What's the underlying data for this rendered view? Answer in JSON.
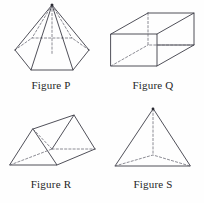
{
  "page": {
    "background_color": "#fefefe",
    "line_color": "#3c3c46",
    "hidden_line_color": "#6e6e78"
  },
  "figures": [
    {
      "id": "figure-p",
      "caption": "Figure P",
      "shape_name": "hexagonal-pyramid",
      "faces": 7,
      "edges": 12,
      "vertices": 7,
      "base_shape": "hexagon",
      "apex": {
        "x": 52,
        "y": 5
      },
      "base_vertices": [
        {
          "x": 15,
          "y": 50
        },
        {
          "x": 31,
          "y": 70
        },
        {
          "x": 73,
          "y": 70
        },
        {
          "x": 89,
          "y": 50
        },
        {
          "x": 72,
          "y": 38
        },
        {
          "x": 32,
          "y": 38
        }
      ],
      "hidden_edge_indices": [
        4,
        5
      ],
      "center": {
        "x": 52,
        "y": 54
      }
    },
    {
      "id": "figure-q",
      "caption": "Figure Q",
      "shape_name": "rectangular-prism",
      "faces": 6,
      "edges": 12,
      "vertices": 8,
      "base_shape": "rectangle",
      "front_face": [
        {
          "x": 9,
          "y": 34
        },
        {
          "x": 55,
          "y": 34
        },
        {
          "x": 55,
          "y": 66
        },
        {
          "x": 9,
          "y": 66
        }
      ],
      "back_offset": {
        "dx": 37,
        "dy": -21
      },
      "hidden_vertex": {
        "x": 46,
        "y": 45
      }
    },
    {
      "id": "figure-r",
      "caption": "Figure R",
      "shape_name": "triangular-prism",
      "faces": 5,
      "edges": 9,
      "vertices": 6,
      "base_shape": "triangle",
      "near_triangle": [
        {
          "x": 10,
          "y": 64
        },
        {
          "x": 57,
          "y": 64
        },
        {
          "x": 33,
          "y": 28
        }
      ],
      "far_triangle": [
        {
          "x": 52,
          "y": 48
        },
        {
          "x": 95,
          "y": 48
        },
        {
          "x": 74,
          "y": 14
        }
      ],
      "hidden_vertex": {
        "x": 52,
        "y": 48
      }
    },
    {
      "id": "figure-s",
      "caption": "Figure S",
      "shape_name": "triangular-pyramid-tetrahedron",
      "faces": 4,
      "edges": 6,
      "vertices": 4,
      "base_shape": "triangle",
      "apex": {
        "x": 51,
        "y": 8
      },
      "base_vertices": [
        {
          "x": 13,
          "y": 65
        },
        {
          "x": 88,
          "y": 65
        },
        {
          "x": 51,
          "y": 54
        }
      ]
    }
  ]
}
